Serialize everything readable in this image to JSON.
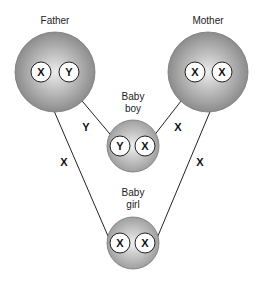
{
  "diagram": {
    "type": "sex-chromosome-inheritance",
    "nodes": {
      "father": {
        "label": "Father",
        "chromosomes": [
          "X",
          "Y"
        ]
      },
      "mother": {
        "label": "Mother",
        "chromosomes": [
          "X",
          "X"
        ]
      },
      "baby_boy": {
        "label_line1": "Baby",
        "label_line2": "boy",
        "chromosomes": [
          "Y",
          "X"
        ]
      },
      "baby_girl": {
        "label_line1": "Baby",
        "label_line2": "girl",
        "chromosomes": [
          "X",
          "X"
        ]
      }
    },
    "edges": [
      {
        "from": "father.Y",
        "to": "baby_boy.Y",
        "label": "Y"
      },
      {
        "from": "mother.X",
        "to": "baby_boy.X",
        "label": "X"
      },
      {
        "from": "father.X",
        "to": "baby_girl.X",
        "label": "X"
      },
      {
        "from": "mother.X",
        "to": "baby_girl.X",
        "label": "X"
      }
    ],
    "colors": {
      "circle_light": "#e8e8e8",
      "circle_dark": "#8a8a8a",
      "chromosome_fill": "#ffffff",
      "stroke": "#222222"
    }
  }
}
